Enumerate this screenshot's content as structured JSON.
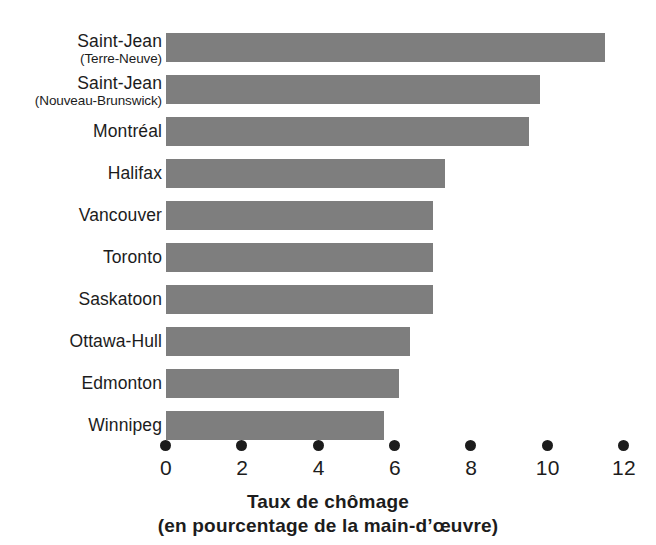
{
  "chart_data": {
    "type": "bar",
    "orientation": "horizontal",
    "title": "Taux de chômage",
    "subtitle": "(en pourcentage de la main-d’œuvre)",
    "xlabel": "Taux de chômage (en pourcentage de la main-d’œuvre)",
    "ylabel": "",
    "xlim": [
      0,
      12
    ],
    "xticks": [
      0,
      2,
      4,
      6,
      8,
      10,
      12
    ],
    "xtick_labels": [
      "0",
      "2",
      "4",
      "6",
      "8",
      "10",
      "12"
    ],
    "grid": false,
    "legend": false,
    "bar_color": "#7e7e7e",
    "text_color": "#1c1c1c",
    "background": "#ffffff",
    "categories": [
      "Saint-Jean (Terre-Neuve)",
      "Saint-Jean (Nouveau-Brunswick)",
      "Montréal",
      "Halifax",
      "Vancouver",
      "Toronto",
      "Saskatoon",
      "Ottawa-Hull",
      "Edmonton",
      "Winnipeg"
    ],
    "values": [
      11.5,
      9.8,
      9.5,
      7.3,
      7.0,
      7.0,
      7.0,
      6.4,
      6.1,
      5.7
    ],
    "bars": [
      {
        "label_line1": "Saint-Jean",
        "label_line2": "(Terre-Neuve)",
        "value": 11.5
      },
      {
        "label_line1": "Saint-Jean",
        "label_line2": "(Nouveau-Brunswick)",
        "value": 9.8
      },
      {
        "label_line1": "Montréal",
        "label_line2": "",
        "value": 9.5
      },
      {
        "label_line1": "Halifax",
        "label_line2": "",
        "value": 7.3
      },
      {
        "label_line1": "Vancouver",
        "label_line2": "",
        "value": 7.0
      },
      {
        "label_line1": "Toronto",
        "label_line2": "",
        "value": 7.0
      },
      {
        "label_line1": "Saskatoon",
        "label_line2": "",
        "value": 7.0
      },
      {
        "label_line1": "Ottawa-Hull",
        "label_line2": "",
        "value": 6.4
      },
      {
        "label_line1": "Edmonton",
        "label_line2": "",
        "value": 6.1
      },
      {
        "label_line1": "Winnipeg",
        "label_line2": "",
        "value": 5.7
      }
    ]
  },
  "caption": {
    "line1": "Taux de chômage",
    "line2": "(en pourcentage de la main-d’œuvre)"
  }
}
